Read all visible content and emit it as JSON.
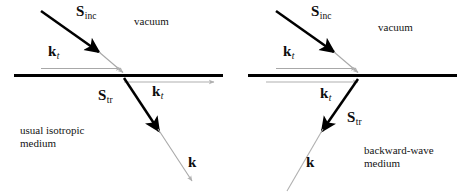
{
  "figure": {
    "type": "physics-diagram",
    "colors": {
      "interface": "#000000",
      "bold_vector": "#000000",
      "ray_gray": "#a8a8a8",
      "text": "#0d0d0d"
    }
  },
  "panels": [
    {
      "id": "left",
      "upper_region_label": "vacuum",
      "medium_label_line1": "usual isotropic",
      "medium_label_line2": "medium",
      "vectors": {
        "incident_poynting": {
          "symbol": "S",
          "subscript": "inc"
        },
        "tangential_k_upper": {
          "symbol": "k",
          "subscript": "t"
        },
        "transmitted_poynting": {
          "symbol": "S",
          "subscript": "tr"
        },
        "tangential_k_lower": {
          "symbol": "k",
          "subscript": "t"
        },
        "wavevector": {
          "symbol": "k",
          "subscript": ""
        }
      }
    },
    {
      "id": "right",
      "upper_region_label": "vacuum",
      "medium_label_line1": "backward-wave",
      "medium_label_line2": "medium",
      "vectors": {
        "incident_poynting": {
          "symbol": "S",
          "subscript": "inc"
        },
        "tangential_k_upper": {
          "symbol": "k",
          "subscript": "t"
        },
        "transmitted_poynting": {
          "symbol": "S",
          "subscript": "tr"
        },
        "tangential_k_lower": {
          "symbol": "k",
          "subscript": "t"
        },
        "wavevector": {
          "symbol": "k",
          "subscript": ""
        }
      }
    }
  ]
}
